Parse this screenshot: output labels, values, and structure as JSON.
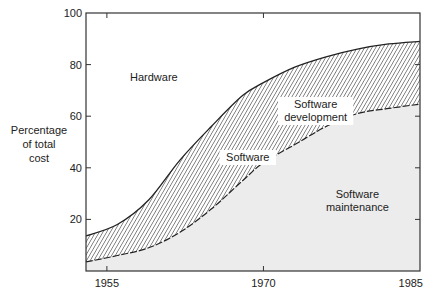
{
  "chart_data": {
    "type": "area",
    "title": "",
    "xlabel": "",
    "ylabel": "Percentage of total cost",
    "ylabel_lines": [
      "Percentage",
      "of total",
      "cost"
    ],
    "xlim": [
      1953,
      1985
    ],
    "ylim": [
      0,
      100
    ],
    "x_ticks": [
      1955,
      1970,
      1985
    ],
    "x_tick_labels": [
      "1955",
      "1970",
      "1985"
    ],
    "y_ticks": [
      20,
      40,
      60,
      80,
      100
    ],
    "y_tick_labels": [
      "20",
      "40",
      "60",
      "80",
      "100"
    ],
    "grid": false,
    "legend": "none (areas labeled inline)",
    "x": [
      1953,
      1956,
      1959,
      1962,
      1965,
      1968,
      1970,
      1973,
      1976,
      1979,
      1982,
      1985
    ],
    "series": [
      {
        "name": "Software maintenance",
        "description": "lower boundary (maintenance / development)",
        "values": [
          3.5,
          6,
          9,
          15,
          24,
          35,
          42,
          49,
          56,
          61,
          63,
          64.7
        ],
        "fill": "#ececec",
        "line_style": "dashed"
      },
      {
        "name": "Software (total: development + maintenance)",
        "description": "upper boundary (software / hardware)",
        "values": [
          13.6,
          18,
          27.5,
          43,
          56,
          68,
          73,
          79,
          83,
          86,
          88,
          89
        ],
        "fill": "hatched",
        "line_style": "solid"
      }
    ],
    "annotations": [
      {
        "text": "Hardware",
        "x": 1959.5,
        "y": 75
      },
      {
        "text": "Software",
        "x": 1968.5,
        "y": 44
      },
      {
        "text": "Software development",
        "lines": [
          "Software",
          "development"
        ],
        "x": 1975,
        "y": 62
      },
      {
        "text": "Software maintenance",
        "lines": [
          "Software",
          "maintenance"
        ],
        "x": 1979,
        "y": 27
      }
    ],
    "colors": {
      "background": "#ffffff",
      "maintenance_fill": "#ececec",
      "hatch": "#333333",
      "axis": "#333333"
    }
  }
}
